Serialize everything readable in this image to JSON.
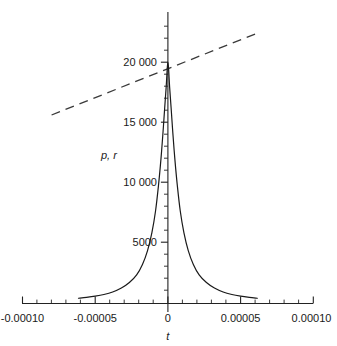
{
  "chart_data": {
    "type": "line",
    "title": "",
    "xlabel": "t",
    "ylabel": "p, r",
    "xlim": [
      -0.0001,
      0.0001
    ],
    "ylim": [
      0,
      22400
    ],
    "grid": false,
    "legend": "none",
    "xticks": [
      -0.0001,
      -5e-05,
      0,
      5e-05,
      0.0001
    ],
    "xticklabels": [
      "-0.00010",
      "-0.00005",
      "0",
      "0.00005",
      "0.00010"
    ],
    "yticks": [
      5000,
      10000,
      15000,
      20000
    ],
    "yticklabels": [
      "5000",
      "10 000",
      "15 000",
      "20 000"
    ],
    "minor_tick_count_per_interval": 4,
    "series": [
      {
        "name": "p",
        "style": "solid",
        "color": "#1a1a1a",
        "comment": "sharp symmetric peak centered at t=0 with peak value 20000",
        "x": [
          -6.15e-05,
          -5.6e-05,
          -5e-05,
          -4.4e-05,
          -3.8e-05,
          -3.2e-05,
          -2.65e-05,
          -2.15e-05,
          -1.75e-05,
          -1.4e-05,
          -1.1e-05,
          -8.5e-06,
          -6.5e-06,
          -4.8e-06,
          -3.4e-06,
          -2.2e-06,
          -1.2e-06,
          -5e-07,
          0.0,
          5e-07,
          1.2e-06,
          2.2e-06,
          3.4e-06,
          4.8e-06,
          6.5e-06,
          8.5e-06,
          1.1e-05,
          1.4e-05,
          1.75e-05,
          2.15e-05,
          2.65e-05,
          3.2e-05,
          3.8e-05,
          4.4e-05,
          5e-05,
          5.6e-05,
          6.15e-05
        ],
        "y": [
          330,
          400,
          500,
          640,
          850,
          1180,
          1640,
          2280,
          3150,
          4300,
          5800,
          7600,
          9700,
          11900,
          14100,
          16200,
          17900,
          19400,
          20000,
          19400,
          17900,
          16200,
          14100,
          11900,
          9700,
          7600,
          5800,
          4300,
          3150,
          2280,
          1640,
          1180,
          850,
          640,
          500,
          400,
          330
        ]
      },
      {
        "name": "r",
        "style": "dashed",
        "color": "#3a3a3a",
        "comment": "straight line of positive slope passing near (0, 20000)",
        "x": [
          -8e-05,
          6e-05
        ],
        "y": [
          15600,
          22350
        ]
      }
    ]
  },
  "plot": {
    "background_color": "#ffffff",
    "axis_color": "#222222",
    "curve_color": "#1a1a1a",
    "dash_color": "#3a3a3a",
    "text_color": "#1a1a1a"
  }
}
